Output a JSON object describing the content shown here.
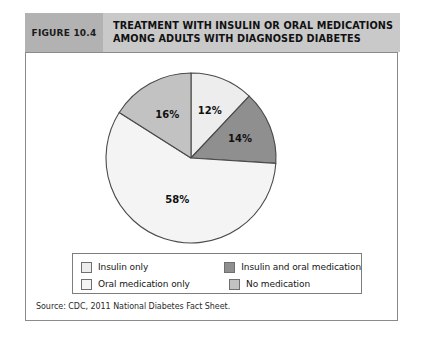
{
  "header": {
    "figure_number": "FIGURE 10.4",
    "title_line_1": "TREATMENT WITH INSULIN OR ORAL MEDICATIONS",
    "title_line_2": "AMONG ADULTS WITH DIAGNOSED DIABETES",
    "bar_color": "#c9c9c9",
    "number_box_color": "#b2b2b2"
  },
  "source": {
    "text": "Source: CDC, 2011 National Diabetes Fact Sheet."
  },
  "legend": {
    "entries": [
      {
        "label": "Insulin only",
        "color": "#ededed"
      },
      {
        "label": "Insulin and oral medication",
        "color": "#8f8f8f"
      },
      {
        "label": "Oral medication only",
        "color": "#f4f4f4"
      },
      {
        "label": "No medication",
        "color": "#c2c2c2"
      }
    ]
  },
  "chart_data": {
    "type": "pie",
    "title": "TREATMENT WITH INSULIN OR ORAL MEDICATIONS AMONG ADULTS WITH DIAGNOSED DIABETES",
    "unit": "percent",
    "start_angle_deg": 0,
    "direction": "clockwise",
    "legend_position": "bottom",
    "categories": [
      "Insulin only",
      "Insulin and oral medication",
      "Oral medication only",
      "No medication"
    ],
    "values": [
      12,
      14,
      58,
      16
    ],
    "labels": [
      "12%",
      "14%",
      "58%",
      "16%"
    ],
    "colors": [
      "#ededed",
      "#8f8f8f",
      "#f4f4f4",
      "#c2c2c2"
    ],
    "slices": [
      {
        "name": "Insulin only",
        "value": 12,
        "label": "12%",
        "color": "#ededed",
        "start_deg": 0,
        "end_deg": 43.2
      },
      {
        "name": "Insulin and oral medication",
        "value": 14,
        "label": "14%",
        "color": "#8f8f8f",
        "start_deg": 43.2,
        "end_deg": 93.6
      },
      {
        "name": "Oral medication only",
        "value": 58,
        "label": "58%",
        "color": "#f4f4f4",
        "start_deg": 93.6,
        "end_deg": 302.4
      },
      {
        "name": "No medication",
        "value": 16,
        "label": "16%",
        "color": "#c2c2c2",
        "start_deg": 302.4,
        "end_deg": 360
      }
    ]
  }
}
